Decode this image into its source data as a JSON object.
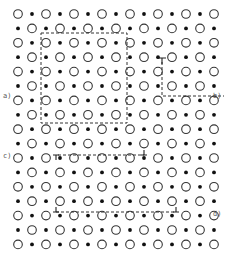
{
  "diagram": {
    "lattice": {
      "rows": 17,
      "columns": 15,
      "site_types": [
        "open-circle",
        "filled-dot"
      ],
      "pattern": "alternating checkerboard"
    },
    "labels": [
      {
        "id": "a",
        "text": "a)"
      },
      {
        "id": "b",
        "text": "b)"
      },
      {
        "id": "c",
        "text": "c)"
      },
      {
        "id": "d",
        "text": "d)"
      }
    ],
    "features": [
      {
        "id": "a",
        "kind": "dashed-rectangle"
      },
      {
        "id": "b",
        "kind": "dashed-L-with-dislocation-symbol"
      },
      {
        "id": "c",
        "kind": "dashed-line-between-two-dislocations"
      },
      {
        "id": "d",
        "kind": "dashed-line-between-two-dislocations"
      }
    ]
  }
}
